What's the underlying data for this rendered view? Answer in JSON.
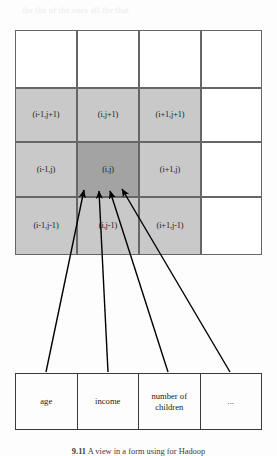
{
  "figure": {
    "type": "diagram",
    "caption": {
      "number": "9.11",
      "text": "A view in a form using for Hadoop"
    }
  },
  "grid": {
    "columns": 4,
    "rows": 4,
    "colors": {
      "cell_background": "#ffffff",
      "neighbour_shade": "#c9c9c9",
      "center_shade": "#a3a3a3",
      "border": "#666666"
    },
    "cells": [
      {
        "row": 0,
        "col": 0,
        "label": "",
        "shade": "none"
      },
      {
        "row": 0,
        "col": 1,
        "label": "",
        "shade": "none"
      },
      {
        "row": 0,
        "col": 2,
        "label": "",
        "shade": "none"
      },
      {
        "row": 0,
        "col": 3,
        "label": "",
        "shade": "none"
      },
      {
        "row": 1,
        "col": 0,
        "label": "(i-1,j+1)",
        "shade": "light"
      },
      {
        "row": 1,
        "col": 1,
        "label": "(i,j+1)",
        "shade": "light"
      },
      {
        "row": 1,
        "col": 2,
        "label": "(i+1,j+1)",
        "shade": "light"
      },
      {
        "row": 1,
        "col": 3,
        "label": "",
        "shade": "none"
      },
      {
        "row": 2,
        "col": 0,
        "label": "(i-1,j)",
        "shade": "light"
      },
      {
        "row": 2,
        "col": 1,
        "label": "(i,j)",
        "shade": "dark"
      },
      {
        "row": 2,
        "col": 2,
        "label": "(i+1,j)",
        "shade": "light"
      },
      {
        "row": 2,
        "col": 3,
        "label": "",
        "shade": "none"
      },
      {
        "row": 3,
        "col": 0,
        "label": "(i-1,j-1)",
        "shade": "light"
      },
      {
        "row": 3,
        "col": 1,
        "label": "(i,j-1)",
        "shade": "light"
      },
      {
        "row": 3,
        "col": 2,
        "label": "(i+1,j-1)",
        "shade": "light"
      },
      {
        "row": 3,
        "col": 3,
        "label": "",
        "shade": "none"
      }
    ]
  },
  "tuple_table": {
    "columns": 4,
    "cells": [
      {
        "label": "age"
      },
      {
        "label": "income"
      },
      {
        "label": "number of children"
      },
      {
        "label": "..."
      }
    ]
  },
  "arrows": {
    "count": 4,
    "description": "each attribute cell points up to the centre cell (i,j)",
    "color": "#000000"
  },
  "bleed_through": {
    "lines": [
      "the the of the ones all the that",
      "of the for number to column"
    ]
  }
}
